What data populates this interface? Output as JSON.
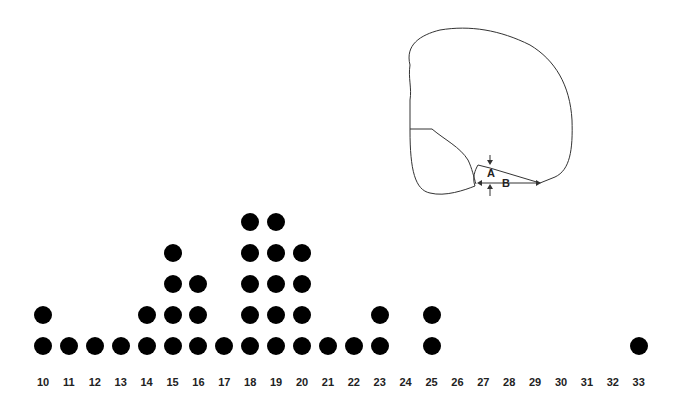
{
  "chart_data": {
    "type": "scatter",
    "subtype": "dot-plot",
    "title": "",
    "xlabel": "",
    "ylabel": "",
    "x_ticks": [
      10,
      11,
      12,
      13,
      14,
      15,
      16,
      17,
      18,
      19,
      20,
      21,
      22,
      23,
      24,
      25,
      26,
      27,
      28,
      29,
      30,
      31,
      32,
      33
    ],
    "categories": [
      "10",
      "11",
      "12",
      "13",
      "14",
      "15",
      "16",
      "17",
      "18",
      "19",
      "20",
      "21",
      "22",
      "23",
      "24",
      "25",
      "26",
      "27",
      "28",
      "29",
      "30",
      "31",
      "32",
      "33"
    ],
    "values": [
      2,
      1,
      1,
      1,
      2,
      4,
      3,
      1,
      5,
      5,
      4,
      1,
      1,
      2,
      0,
      2,
      0,
      0,
      0,
      0,
      0,
      0,
      0,
      1
    ],
    "counts": {
      "10": 2,
      "11": 1,
      "12": 1,
      "13": 1,
      "14": 2,
      "15": 4,
      "16": 3,
      "17": 1,
      "18": 5,
      "19": 5,
      "20": 4,
      "21": 1,
      "22": 1,
      "23": 2,
      "24": 0,
      "25": 2,
      "26": 0,
      "27": 0,
      "28": 0,
      "29": 0,
      "30": 0,
      "31": 0,
      "32": 0,
      "33": 1
    },
    "grid": false,
    "legend": null,
    "marker": {
      "shape": "circle",
      "color": "#000000"
    }
  },
  "diagram": {
    "labels": {
      "a": "A",
      "b": "B"
    }
  },
  "layout": {
    "x_start_px": 43,
    "x_step_px": 25.9,
    "baseline_y_px": 346,
    "row_step_px": 31
  }
}
